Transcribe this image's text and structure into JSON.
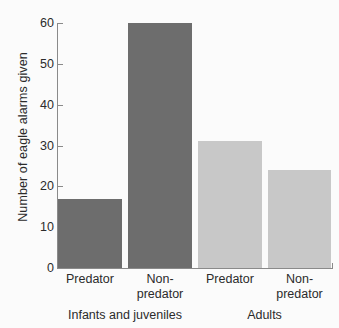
{
  "chart_data": {
    "type": "bar",
    "title": "",
    "xlabel": "",
    "ylabel": "Number of eagle alarms given",
    "ylim": [
      0,
      60
    ],
    "ytick_values": [
      0,
      10,
      20,
      30,
      40,
      50,
      60
    ],
    "ytick_labels": [
      "0",
      "10",
      "20",
      "30",
      "40",
      "50",
      "60"
    ],
    "grid": false,
    "legend": "none",
    "categories": [
      "Predator",
      "Non-predator",
      "Predator",
      "Non-predator"
    ],
    "values": [
      17,
      60,
      31,
      24
    ],
    "bar_colors": [
      "#6d6d6d",
      "#6d6d6d",
      "#c8c8c8",
      "#c8c8c8"
    ],
    "groups": [
      {
        "label": "Infants and juveniles",
        "categories": [
          "Predator",
          "Non-predator"
        ],
        "values": [
          17,
          60
        ]
      },
      {
        "label": "Adults",
        "categories": [
          "Predator",
          "Non-predator"
        ],
        "values": [
          31,
          24
        ]
      }
    ],
    "bars": [
      {
        "label_line1": "Predator",
        "label_line2": "",
        "value": 17,
        "color": "#6d6d6d",
        "group": "Infants and juveniles"
      },
      {
        "label_line1": "Non-",
        "label_line2": "predator",
        "value": 60,
        "color": "#6d6d6d",
        "group": "Infants and juveniles"
      },
      {
        "label_line1": "Predator",
        "label_line2": "",
        "value": 31,
        "color": "#c8c8c8",
        "group": "Adults"
      },
      {
        "label_line1": "Non-",
        "label_line2": "predator",
        "value": 24,
        "color": "#c8c8c8",
        "group": "Adults"
      }
    ]
  },
  "colors": {
    "background": "#fbfbfb",
    "axis": "#8a8a8a",
    "text": "#2b2b2b",
    "dark_bar": "#6d6d6d",
    "light_bar": "#c8c8c8"
  }
}
